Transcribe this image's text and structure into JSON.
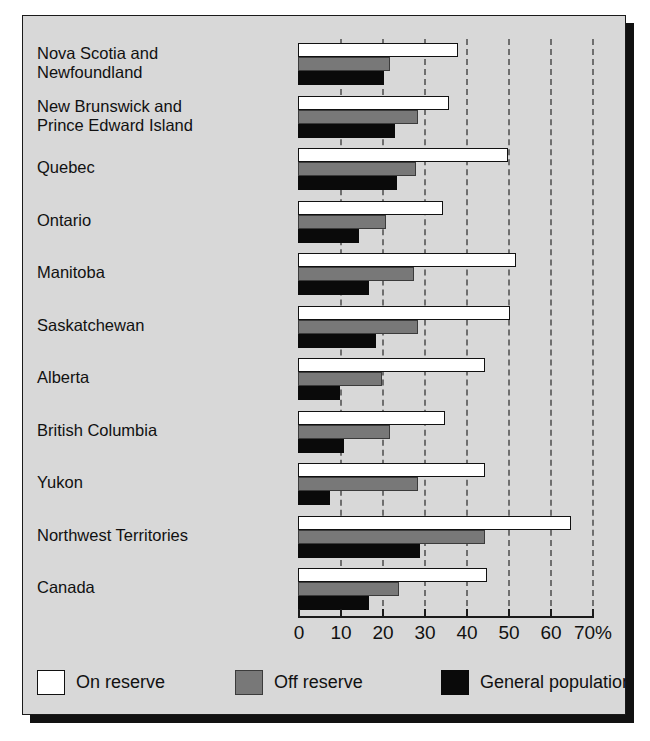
{
  "chart_data": {
    "type": "bar",
    "orientation": "horizontal",
    "title": "",
    "subtitle": "",
    "xlabel": "",
    "ylabel": "",
    "xlim": [
      0,
      70
    ],
    "xticks": [
      0,
      10,
      20,
      30,
      40,
      50,
      60,
      70
    ],
    "xtick_labels": [
      "0",
      "10",
      "20",
      "30",
      "40",
      "50",
      "60",
      "70%"
    ],
    "grid": "vertical-dashed",
    "legend_position": "bottom-left",
    "categories": [
      "Nova Scotia and\nNewfoundland",
      "New Brunswick and\nPrince Edward Island",
      "Quebec",
      "Ontario",
      "Manitoba",
      "Saskatchewan",
      "Alberta",
      "British Columbia",
      "Yukon",
      "Northwest Territories",
      "Canada"
    ],
    "series": [
      {
        "name": "On reserve",
        "color": "#ffffff",
        "values": [
          38,
          36,
          50,
          34.5,
          52,
          50.5,
          44.5,
          35,
          44.5,
          65,
          45
        ]
      },
      {
        "name": "Off reserve",
        "color": "#787878",
        "values": [
          22,
          28.5,
          28,
          21,
          27.5,
          28.5,
          20,
          22,
          28.5,
          44.5,
          24
        ]
      },
      {
        "name": "General population",
        "color": "#0a0a0a",
        "values": [
          20.5,
          23,
          23.5,
          14.5,
          17,
          18.5,
          10,
          11,
          7.5,
          29,
          17
        ]
      }
    ]
  },
  "legend": {
    "items": [
      {
        "label": "On reserve",
        "swatch": "on"
      },
      {
        "label": "Off reserve",
        "swatch": "off"
      },
      {
        "label": "General population",
        "swatch": "gen"
      }
    ]
  },
  "colors": {
    "background": "#d8d8d8",
    "frame": "#1a1a1a",
    "on_reserve": "#ffffff",
    "off_reserve": "#787878",
    "general_population": "#0a0a0a",
    "gridline": "#6f6f6f"
  }
}
